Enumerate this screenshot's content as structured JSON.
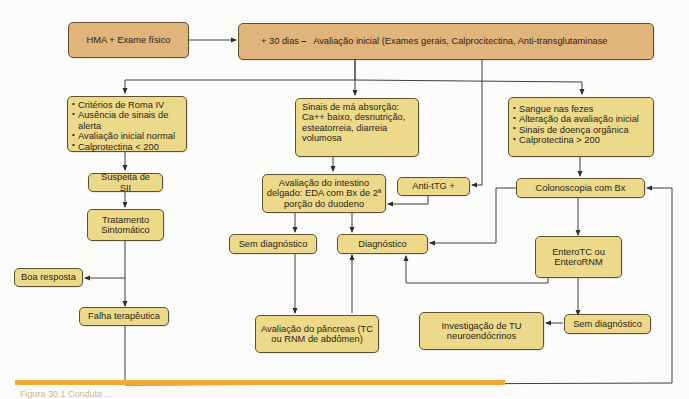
{
  "diagram": {
    "nodes": {
      "hma": "HMA + Exame físico",
      "initial_prefix": "+ 30 dias",
      "initial_dash": "–",
      "initial_text": "Avaliação inicial (Exames gerais, Calprocitectina, Anti-transglutaminase",
      "roma_items": [
        "Critérios de Roma IV",
        "Ausência de sinais de alerta",
        "Avaliação inicial normal",
        "Calprotectina < 200"
      ],
      "malabsorption": "Sinais de má absorção: Ca++ baixo, desnutrição, esteatorreia, diarreia volumosa",
      "organic_items": [
        "Sangue nas fezes",
        "Alteração da avaliação inicial",
        "Sinais de doença orgânica",
        "Calprotectina > 200"
      ],
      "sii_suspect": "Suspeita de SII",
      "small_bowel": "Avaliação do intestino delgado: EDA com Bx de 2ª porção do duodeno",
      "anti_ttg": "Anti-tTG +",
      "colonoscopy": "Colonoscopia com Bx",
      "symptomatic": "Tratamento Sintomático",
      "no_diagnosis_1": "Sem diagnóstico",
      "diagnosis": "Diagnóstico",
      "enterotc": "EnteroTC ou EnteroRNM",
      "good_response": "Boa resposta",
      "failure": "Falha terapêutica",
      "pancreas": "Avaliação do pâncreas (TC ou RNM de abdômen)",
      "net_investigation": "Investigação de TU neuroendócrinos",
      "no_diagnosis_2": "Sem diagnóstico"
    },
    "colors": {
      "orange_box": "#e0b47a",
      "yellow_box": "#ecd98a",
      "rule": "#f0a93a",
      "line": "#3a3a3a"
    }
  },
  "caption": "Figura 30.1  Conduta ..."
}
